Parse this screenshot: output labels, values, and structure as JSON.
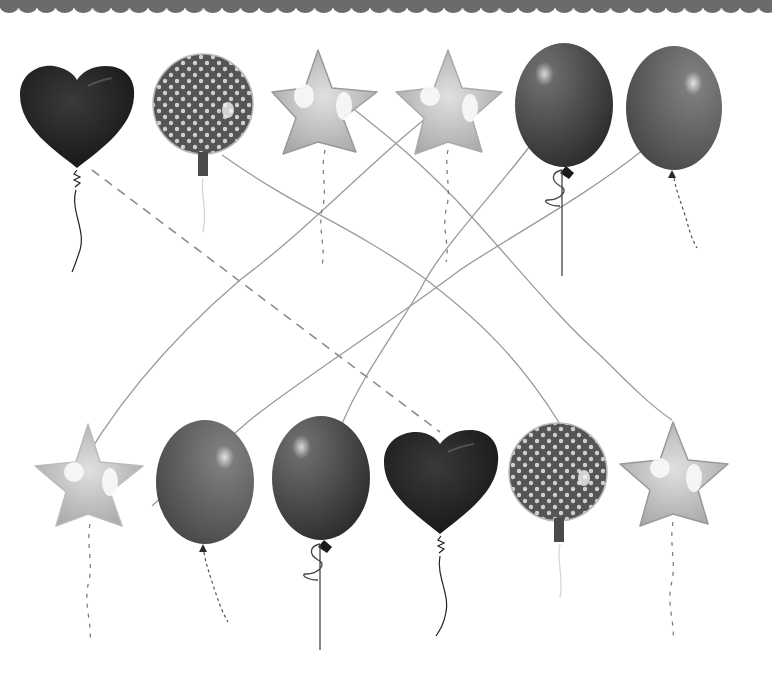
{
  "worksheet": {
    "title": "Match the balloons",
    "instruction": "Draw a line to connect each balloon to its matching balloon"
  },
  "colors": {
    "border": "#6b6b6b",
    "line": "#9a9a9a",
    "dashed_line": "#8c8c8c",
    "heart": "#1e1e1e",
    "polka_base": "#555555",
    "polka_dot": "#cfcfcf",
    "star_foil": "#bdbdbd",
    "star_highlight": "#f5f5f5",
    "latex_dark": "#3e3e3e",
    "latex_mid": "#5a5a5a"
  },
  "top_row": [
    {
      "id": "top-1",
      "type": "heart",
      "cx": 77,
      "cy": 112
    },
    {
      "id": "top-2",
      "type": "polka-dot-round",
      "cx": 203,
      "cy": 104
    },
    {
      "id": "top-3",
      "type": "star",
      "cx": 318,
      "cy": 102
    },
    {
      "id": "top-4",
      "type": "star",
      "cx": 448,
      "cy": 102
    },
    {
      "id": "top-5",
      "type": "latex-dark",
      "cx": 564,
      "cy": 105
    },
    {
      "id": "top-6",
      "type": "latex-mid",
      "cx": 674,
      "cy": 108
    }
  ],
  "bottom_row": [
    {
      "id": "bottom-1",
      "type": "star",
      "cx": 88,
      "cy": 474
    },
    {
      "id": "bottom-2",
      "type": "latex-mid",
      "cx": 205,
      "cy": 482
    },
    {
      "id": "bottom-3",
      "type": "latex-dark",
      "cx": 321,
      "cy": 478
    },
    {
      "id": "bottom-4",
      "type": "heart",
      "cx": 440,
      "cy": 478
    },
    {
      "id": "bottom-5",
      "type": "polka-dot-round",
      "cx": 558,
      "cy": 472
    },
    {
      "id": "bottom-6",
      "type": "star",
      "cx": 673,
      "cy": 472
    }
  ],
  "connections": [
    {
      "from": "top-1",
      "to": "bottom-4",
      "style": "dashed"
    },
    {
      "from": "top-2",
      "to": "bottom-5",
      "style": "solid"
    },
    {
      "from": "top-3",
      "to": "bottom-6",
      "style": "solid"
    },
    {
      "from": "top-4",
      "to": "bottom-1",
      "style": "solid"
    },
    {
      "from": "top-5",
      "to": "bottom-3",
      "style": "solid"
    },
    {
      "from": "top-6",
      "to": "bottom-2",
      "style": "solid"
    }
  ]
}
